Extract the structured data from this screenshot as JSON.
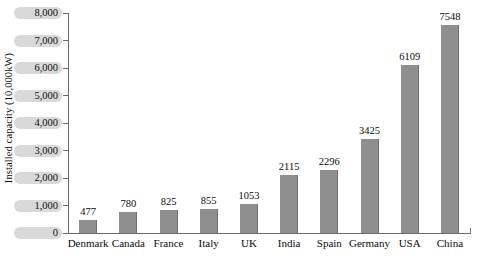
{
  "chart_data": {
    "type": "bar",
    "title": "",
    "xlabel": "",
    "ylabel": "Installed capacity (10,000kW)",
    "categories": [
      "Denmark",
      "Canada",
      "France",
      "Italy",
      "UK",
      "India",
      "Spain",
      "Germany",
      "USA",
      "China"
    ],
    "values": [
      477,
      780,
      825,
      855,
      1053,
      2115,
      2296,
      3425,
      6109,
      7548
    ],
    "value_labels": [
      "477",
      "780",
      "825",
      "855",
      "1053",
      "2115",
      "2296",
      "3425",
      "6109",
      "7548"
    ],
    "ylim": [
      0,
      8000
    ],
    "ytick_values": [
      0,
      1000,
      2000,
      3000,
      4000,
      5000,
      6000,
      7000,
      8000
    ],
    "ytick_labels": [
      "0",
      "1,000",
      "2,000",
      "3,000",
      "4,000",
      "5,000",
      "6,000",
      "7,000",
      "8,000"
    ],
    "grid": false,
    "legend": false,
    "legend_position": "none",
    "bar_color": "#8f8f8f",
    "axis_color": "#6b6b6b",
    "text_color": "#0a0a0a"
  }
}
